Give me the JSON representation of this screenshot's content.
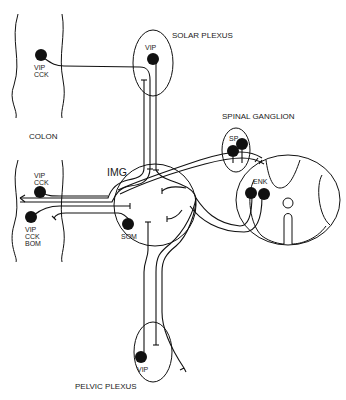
{
  "diagram": {
    "type": "neuroanatomy-schematic",
    "colors": {
      "line": "#111111",
      "background": "#ffffff"
    },
    "regions": {
      "colon": {
        "label": "COLON"
      },
      "solar_plexus": {
        "label": "SOLAR PLEXUS",
        "cell_label": "VIP"
      },
      "spinal_ganglion": {
        "label": "SPINAL GANGLION",
        "cell_label": "SP"
      },
      "img": {
        "label": "IMG",
        "cell_label": "SOM"
      },
      "spinal_cord": {
        "cell_label": "ENK"
      },
      "pelvic_plexus": {
        "label": "PELVIC PLEXUS",
        "cell_label": "VIP"
      }
    },
    "colon_cells": [
      {
        "line1": "VIP",
        "line2": "CCK"
      },
      {
        "line1": "VIP",
        "line2": "CCK"
      },
      {
        "line1": "VIP",
        "line2": "CCK",
        "line3": "BOM"
      }
    ]
  }
}
